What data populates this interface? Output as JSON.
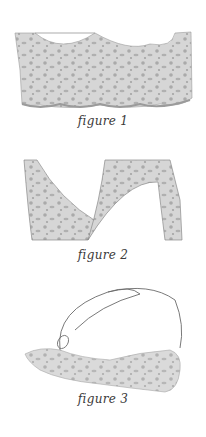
{
  "figures": [
    {
      "id": 1,
      "caption": "figure 1",
      "subject": "lace-strip-scalloped-top"
    },
    {
      "id": 2,
      "caption": "figure 2",
      "subject": "lace-cut-pieces"
    },
    {
      "id": 3,
      "caption": "figure 3",
      "subject": "lace-with-tie-string"
    }
  ],
  "colors": {
    "background": "#ffffff",
    "lace_fill": "#d4d4d4",
    "lace_pattern": "#a9a9a9",
    "outline": "#7a7a7a",
    "caption": "#3a3a3a"
  }
}
